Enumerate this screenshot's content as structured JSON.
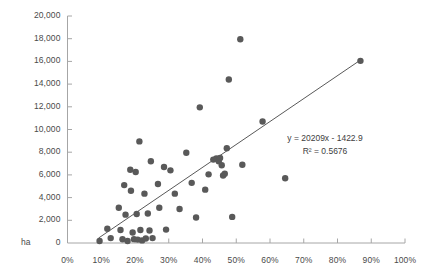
{
  "chart_data": {
    "type": "scatter",
    "title": "",
    "xlabel": "",
    "ylabel": "",
    "y_unit": "ha",
    "xlim": [
      0,
      1.0
    ],
    "ylim": [
      0,
      20000
    ],
    "grid": false,
    "legend": "none",
    "x_tick_labels": [
      "0%",
      "10%",
      "20%",
      "30%",
      "40%",
      "50%",
      "60%",
      "70%",
      "80%",
      "90%",
      "100%"
    ],
    "x_tick_values": [
      0,
      0.1,
      0.2,
      0.3,
      0.4,
      0.5,
      0.6,
      0.7,
      0.8,
      0.9,
      1.0
    ],
    "y_tick_labels": [
      "0",
      "2,000",
      "4,000",
      "6,000",
      "8,000",
      "10,000",
      "12,000",
      "14,000",
      "16,000",
      "18,000",
      "20,000"
    ],
    "y_tick_values": [
      0,
      2000,
      4000,
      6000,
      8000,
      10000,
      12000,
      14000,
      16000,
      18000,
      20000
    ],
    "marker_color": "#595959",
    "marker_radius": 3.2,
    "axis_color": "#a6a6a6",
    "trendline": {
      "label": "y = 20209x - 1422.9",
      "r2_label": "R² = 0.5676",
      "slope": 20209,
      "intercept": -1422.9,
      "r2": 0.5676,
      "color": "#595959",
      "x_start": 0.092,
      "x_end": 0.868
    },
    "points": [
      [
        0.095,
        170
      ],
      [
        0.118,
        1250
      ],
      [
        0.128,
        430
      ],
      [
        0.152,
        3100
      ],
      [
        0.157,
        1150
      ],
      [
        0.163,
        330
      ],
      [
        0.168,
        5100
      ],
      [
        0.172,
        2500
      ],
      [
        0.178,
        170
      ],
      [
        0.186,
        6450
      ],
      [
        0.188,
        4600
      ],
      [
        0.193,
        920
      ],
      [
        0.197,
        340
      ],
      [
        0.202,
        6250
      ],
      [
        0.205,
        2550
      ],
      [
        0.208,
        300
      ],
      [
        0.213,
        8950
      ],
      [
        0.216,
        1150
      ],
      [
        0.221,
        230
      ],
      [
        0.228,
        4350
      ],
      [
        0.232,
        390
      ],
      [
        0.238,
        2600
      ],
      [
        0.243,
        1100
      ],
      [
        0.247,
        7200
      ],
      [
        0.252,
        430
      ],
      [
        0.268,
        5200
      ],
      [
        0.272,
        3100
      ],
      [
        0.286,
        6700
      ],
      [
        0.292,
        1180
      ],
      [
        0.305,
        6400
      ],
      [
        0.318,
        4350
      ],
      [
        0.332,
        3000
      ],
      [
        0.352,
        7950
      ],
      [
        0.368,
        5300
      ],
      [
        0.381,
        2250
      ],
      [
        0.392,
        11950
      ],
      [
        0.408,
        4700
      ],
      [
        0.418,
        6050
      ],
      [
        0.432,
        7350
      ],
      [
        0.441,
        7450
      ],
      [
        0.448,
        7200
      ],
      [
        0.452,
        7500
      ],
      [
        0.457,
        6850
      ],
      [
        0.461,
        5950
      ],
      [
        0.466,
        6100
      ],
      [
        0.472,
        8350
      ],
      [
        0.478,
        14400
      ],
      [
        0.488,
        2300
      ],
      [
        0.512,
        17950
      ],
      [
        0.518,
        6900
      ],
      [
        0.578,
        10700
      ],
      [
        0.645,
        5700
      ],
      [
        0.868,
        16050
      ]
    ]
  }
}
